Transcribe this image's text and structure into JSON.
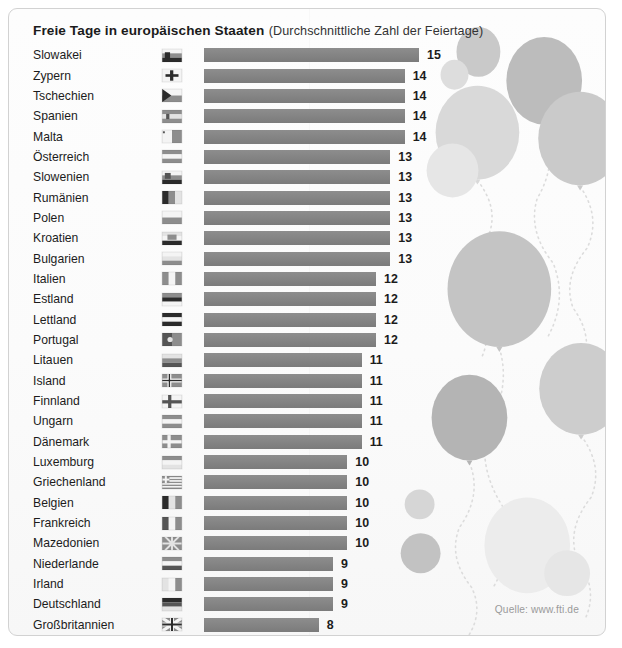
{
  "header": {
    "title_main": "Freie Tage in europäischen Staaten",
    "title_sub": "(Durchschnittliche Zahl der Feiertage)"
  },
  "footer": {
    "source": "Quelle: www.fti.de"
  },
  "colors": {
    "bar": "#858585",
    "panel_bg": "#fbfbfb",
    "frame_border": "#d2d2d2",
    "text": "#1c1c1c",
    "source_text": "#9a9a9a",
    "balloon_light": "#e6e6e6",
    "balloon_mid": "#cfcfcf",
    "balloon_dark": "#b4b4b4",
    "string": "#dcdcdc"
  },
  "chart_data": {
    "type": "bar",
    "orientation": "horizontal",
    "title": "Freie Tage in europäischen Staaten",
    "subtitle": "(Durchschnittliche Zahl der Feiertage)",
    "xlabel": "",
    "ylabel": "",
    "xlim": [
      0,
      15
    ],
    "grid": false,
    "legend": false,
    "source": "Quelle: www.fti.de",
    "value_unit": "Feiertage",
    "categories": [
      "Slowakei",
      "Zypern",
      "Tschechien",
      "Spanien",
      "Malta",
      "Österreich",
      "Slowenien",
      "Rumänien",
      "Polen",
      "Kroatien",
      "Bulgarien",
      "Italien",
      "Estland",
      "Lettland",
      "Portugal",
      "Litauen",
      "Island",
      "Finnland",
      "Ungarn",
      "Dänemark",
      "Luxemburg",
      "Griechenland",
      "Belgien",
      "Frankreich",
      "Mazedonien",
      "Niederlande",
      "Irland",
      "Deutschland",
      "Großbritannien",
      "Schweiz"
    ],
    "values": [
      15,
      14,
      14,
      14,
      14,
      13,
      13,
      13,
      13,
      13,
      13,
      12,
      12,
      12,
      12,
      11,
      11,
      11,
      11,
      11,
      10,
      10,
      10,
      10,
      10,
      9,
      9,
      9,
      8,
      4
    ],
    "rows": [
      {
        "country": "Slowakei",
        "value": 15,
        "flag": "flag-slowakei"
      },
      {
        "country": "Zypern",
        "value": 14,
        "flag": "flag-zypern"
      },
      {
        "country": "Tschechien",
        "value": 14,
        "flag": "flag-tschechien"
      },
      {
        "country": "Spanien",
        "value": 14,
        "flag": "flag-spanien"
      },
      {
        "country": "Malta",
        "value": 14,
        "flag": "flag-malta"
      },
      {
        "country": "Österreich",
        "value": 13,
        "flag": "flag-oesterreich"
      },
      {
        "country": "Slowenien",
        "value": 13,
        "flag": "flag-slowenien"
      },
      {
        "country": "Rumänien",
        "value": 13,
        "flag": "flag-rumaenien"
      },
      {
        "country": "Polen",
        "value": 13,
        "flag": "flag-polen"
      },
      {
        "country": "Kroatien",
        "value": 13,
        "flag": "flag-kroatien"
      },
      {
        "country": "Bulgarien",
        "value": 13,
        "flag": "flag-bulgarien"
      },
      {
        "country": "Italien",
        "value": 12,
        "flag": "flag-italien"
      },
      {
        "country": "Estland",
        "value": 12,
        "flag": "flag-estland"
      },
      {
        "country": "Lettland",
        "value": 12,
        "flag": "flag-lettland"
      },
      {
        "country": "Portugal",
        "value": 12,
        "flag": "flag-portugal"
      },
      {
        "country": "Litauen",
        "value": 11,
        "flag": "flag-litauen"
      },
      {
        "country": "Island",
        "value": 11,
        "flag": "flag-island"
      },
      {
        "country": "Finnland",
        "value": 11,
        "flag": "flag-finnland"
      },
      {
        "country": "Ungarn",
        "value": 11,
        "flag": "flag-ungarn"
      },
      {
        "country": "Dänemark",
        "value": 11,
        "flag": "flag-daenemark"
      },
      {
        "country": "Luxemburg",
        "value": 10,
        "flag": "flag-luxemburg"
      },
      {
        "country": "Griechenland",
        "value": 10,
        "flag": "flag-griechenland"
      },
      {
        "country": "Belgien",
        "value": 10,
        "flag": "flag-belgien"
      },
      {
        "country": "Frankreich",
        "value": 10,
        "flag": "flag-frankreich"
      },
      {
        "country": "Mazedonien",
        "value": 10,
        "flag": "flag-mazedonien"
      },
      {
        "country": "Niederlande",
        "value": 9,
        "flag": "flag-niederlande"
      },
      {
        "country": "Irland",
        "value": 9,
        "flag": "flag-irland"
      },
      {
        "country": "Deutschland",
        "value": 9,
        "flag": "flag-deutschland"
      },
      {
        "country": "Großbritannien",
        "value": 8,
        "flag": "flag-grossbritannien"
      },
      {
        "country": "Schweiz",
        "value": 4,
        "flag": "flag-schweiz"
      }
    ]
  },
  "decorations": {
    "balloons": [
      {
        "name": "balloon-1",
        "cx": 471,
        "cy": 43,
        "rx": 22,
        "ry": 25,
        "fill": "#c9c9c9",
        "string": null
      },
      {
        "name": "balloon-2",
        "cx": 447,
        "cy": 66,
        "rx": 14,
        "ry": 15,
        "fill": "#dddddd",
        "string": null
      },
      {
        "name": "balloon-3",
        "cx": 537,
        "cy": 72,
        "rx": 38,
        "ry": 44,
        "fill": "#bcbcbc",
        "string": [
          [
            537,
            117
          ],
          [
            530,
            190
          ],
          [
            546,
            255
          ],
          [
            540,
            330
          ]
        ]
      },
      {
        "name": "balloon-4",
        "cx": 470,
        "cy": 124,
        "rx": 42,
        "ry": 47,
        "fill": "#d9d9d9",
        "string": [
          [
            470,
            172
          ],
          [
            480,
            230
          ],
          [
            466,
            290
          ],
          [
            474,
            350
          ]
        ]
      },
      {
        "name": "balloon-5",
        "cx": 573,
        "cy": 130,
        "rx": 42,
        "ry": 47,
        "fill": "#cacaca",
        "string": [
          [
            573,
            178
          ],
          [
            580,
            240
          ],
          [
            566,
            300
          ],
          [
            574,
            360
          ]
        ]
      },
      {
        "name": "balloon-6",
        "cx": 445,
        "cy": 162,
        "rx": 26,
        "ry": 27,
        "fill": "#e6e6e6",
        "string": null
      },
      {
        "name": "balloon-7",
        "cx": 492,
        "cy": 281,
        "rx": 52,
        "ry": 58,
        "fill": "#c4c4c4",
        "string": [
          [
            492,
            340
          ],
          [
            480,
            420
          ],
          [
            496,
            500
          ],
          [
            486,
            580
          ]
        ]
      },
      {
        "name": "balloon-8",
        "cx": 574,
        "cy": 381,
        "rx": 42,
        "ry": 46,
        "fill": "#cdcdcd",
        "string": [
          [
            574,
            428
          ],
          [
            584,
            490
          ],
          [
            570,
            552
          ],
          [
            578,
            612
          ]
        ]
      },
      {
        "name": "balloon-9",
        "cx": 462,
        "cy": 410,
        "rx": 38,
        "ry": 43,
        "fill": "#b4b4b4",
        "string": [
          [
            462,
            455
          ],
          [
            452,
            520
          ],
          [
            464,
            580
          ],
          [
            456,
            636
          ]
        ]
      },
      {
        "name": "balloon-10",
        "cx": 412,
        "cy": 497,
        "rx": 15,
        "ry": 15,
        "fill": "#d6d6d6",
        "string": null
      },
      {
        "name": "balloon-11",
        "cx": 413,
        "cy": 546,
        "rx": 20,
        "ry": 20,
        "fill": "#c2c2c2",
        "string": null
      },
      {
        "name": "balloon-12",
        "cx": 520,
        "cy": 538,
        "rx": 43,
        "ry": 48,
        "fill": "#ececec",
        "string": null
      },
      {
        "name": "balloon-13",
        "cx": 560,
        "cy": 566,
        "rx": 23,
        "ry": 23,
        "fill": "#e6e6e6",
        "string": null
      }
    ]
  }
}
